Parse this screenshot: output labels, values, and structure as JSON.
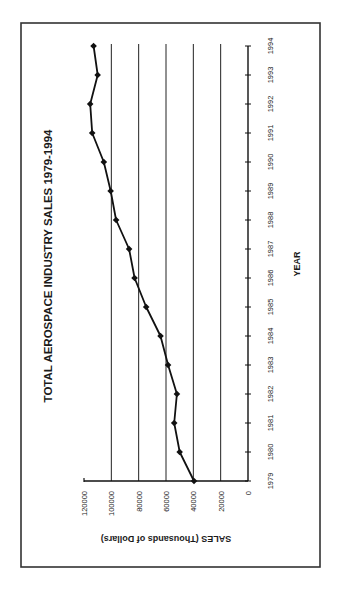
{
  "chart_data": {
    "type": "line",
    "title": "TOTAL AEROSPACE INDUSTRY SALES 1979-1994",
    "xlabel": "YEAR",
    "ylabel": "SALES (Thousands of Dollars)",
    "x": [
      1979,
      1980,
      1981,
      1982,
      1983,
      1984,
      1985,
      1986,
      1987,
      1988,
      1989,
      1990,
      1991,
      1992,
      1993,
      1994
    ],
    "categories": [
      "1979",
      "1980",
      "1981",
      "1982",
      "1983",
      "1984",
      "1985",
      "1986",
      "1987",
      "1988",
      "1989",
      "1990",
      "1991",
      "1992",
      "1993",
      "1994"
    ],
    "series": [
      {
        "name": "Total Aerospace Industry Sales",
        "values": [
          39500,
          50000,
          54000,
          52000,
          58500,
          64000,
          74500,
          83000,
          87000,
          96500,
          100500,
          105500,
          114000,
          115500,
          110000,
          113000
        ]
      }
    ],
    "ylim": [
      0,
      120000
    ],
    "yticks": [
      0,
      20000,
      40000,
      60000,
      80000,
      100000,
      120000
    ],
    "ytick_labels": [
      "0",
      "20000",
      "40000",
      "60000",
      "80000",
      "100000",
      "120000"
    ],
    "grid": {
      "y_major": true,
      "x_major": false
    },
    "legend": null,
    "orientation": "rotated 90 degrees clockwise on page",
    "marker": "diamond",
    "line_color": "#111111"
  }
}
